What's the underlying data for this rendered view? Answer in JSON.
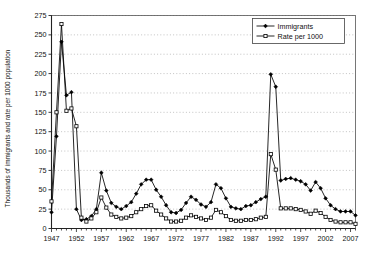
{
  "chart_data": {
    "type": "line",
    "title": "",
    "xlabel": "",
    "ylabel": "Thousands of immigrants and rate per 1000 population",
    "xlim": [
      1947,
      2008
    ],
    "ylim": [
      0,
      275
    ],
    "ytick_step": 25,
    "yticks": [
      0,
      25,
      50,
      75,
      100,
      125,
      150,
      175,
      200,
      225,
      250,
      275
    ],
    "xticks": [
      1947,
      1952,
      1957,
      1962,
      1967,
      1972,
      1977,
      1982,
      1987,
      1992,
      1997,
      2002,
      2007
    ],
    "grid": "horizontal-dotted",
    "legend_position": "top-right",
    "x": [
      1947,
      1948,
      1949,
      1950,
      1951,
      1952,
      1953,
      1954,
      1955,
      1956,
      1957,
      1958,
      1959,
      1960,
      1961,
      1962,
      1963,
      1964,
      1965,
      1966,
      1967,
      1968,
      1969,
      1970,
      1971,
      1972,
      1973,
      1974,
      1975,
      1976,
      1977,
      1978,
      1979,
      1980,
      1981,
      1982,
      1983,
      1984,
      1985,
      1986,
      1987,
      1988,
      1989,
      1990,
      1991,
      1992,
      1993,
      1994,
      1995,
      1996,
      1997,
      1998,
      1999,
      2000,
      2001,
      2002,
      2003,
      2004,
      2005,
      2006,
      2007,
      2008
    ],
    "series": [
      {
        "name": "Immigrants",
        "marker": "filled-diamond",
        "color": "#000000",
        "values": [
          21,
          119,
          241,
          172,
          176,
          25,
          11,
          12,
          16,
          25,
          72,
          49,
          33,
          28,
          25,
          29,
          34,
          45,
          57,
          63,
          63,
          50,
          41,
          30,
          21,
          20,
          24,
          33,
          41,
          37,
          31,
          28,
          34,
          57,
          52,
          39,
          28,
          26,
          25,
          29,
          30,
          34,
          38,
          41,
          199,
          183,
          62,
          64,
          65,
          63,
          61,
          57,
          49,
          60,
          52,
          39,
          30,
          25,
          22,
          22,
          22,
          17
        ]
      },
      {
        "name": "Rate per 1000",
        "marker": "open-square",
        "color": "#000000",
        "values": [
          35,
          150,
          264,
          152,
          155,
          132,
          14,
          9,
          13,
          21,
          40,
          27,
          18,
          15,
          13,
          14,
          16,
          21,
          25,
          29,
          30,
          23,
          18,
          13,
          9,
          9,
          10,
          14,
          17,
          15,
          13,
          11,
          14,
          24,
          21,
          16,
          11,
          10,
          10,
          11,
          11,
          12,
          14,
          15,
          96,
          76,
          26,
          26,
          26,
          25,
          24,
          22,
          19,
          23,
          20,
          15,
          11,
          9,
          8,
          8,
          8,
          6
        ]
      }
    ]
  },
  "legend": {
    "items": [
      {
        "label": "Immigrants",
        "marker": "filled-diamond"
      },
      {
        "label": "Rate per 1000",
        "marker": "open-square"
      }
    ]
  },
  "axis": {
    "y_label": "Thousands of immigrants and rate per 1000 population"
  }
}
